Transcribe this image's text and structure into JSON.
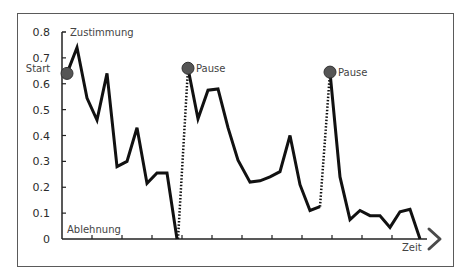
{
  "chart_data": {
    "type": "line",
    "title": "",
    "xlabel": "Zeit",
    "ylabel": "",
    "ylim": [
      0,
      0.8
    ],
    "yticks": [
      "0",
      "0.1",
      "0.2",
      "0.3",
      "0.4",
      "0.5",
      "0.6",
      "0.7",
      "0.8"
    ],
    "ytick_values": [
      0,
      0.1,
      0.2,
      0.3,
      0.4,
      0.5,
      0.6,
      0.7,
      0.8
    ],
    "xlim": [
      0,
      36
    ],
    "xtick_values": [
      3,
      6,
      9,
      12,
      15,
      18,
      21,
      24,
      27,
      30,
      33
    ],
    "grid": false,
    "axis_labels": {
      "top": "Zustimmung",
      "bottom": "Ablehnung",
      "x": "Zeit"
    },
    "series": [
      {
        "name": "Segment 1",
        "style": "solid",
        "x": [
          0.5,
          1.5,
          2.5,
          3.5,
          4.5,
          5.5,
          6.5,
          7.5,
          8.5,
          9.5,
          10.5,
          11.5
        ],
        "values": [
          0.64,
          0.74,
          0.545,
          0.46,
          0.64,
          0.28,
          0.3,
          0.43,
          0.215,
          0.255,
          0.255,
          0
        ]
      },
      {
        "name": "Segment 2",
        "style": "solid",
        "x": [
          12.6,
          13.6,
          14.6,
          15.6,
          16.6,
          17.6,
          18.8,
          19.8,
          20.8,
          21.8,
          22.8,
          23.8,
          24.8,
          25.8
        ],
        "values": [
          0.66,
          0.465,
          0.575,
          0.58,
          0.43,
          0.305,
          0.22,
          0.225,
          0.24,
          0.26,
          0.4,
          0.21,
          0.11,
          0.125
        ]
      },
      {
        "name": "Segment 3",
        "style": "solid",
        "x": [
          26.8,
          27.8,
          28.8,
          29.8,
          30.8,
          31.8,
          32.8,
          33.8,
          34.8,
          35.8
        ],
        "values": [
          0.645,
          0.24,
          0.075,
          0.11,
          0.09,
          0.09,
          0.045,
          0.105,
          0.115,
          0
        ]
      }
    ],
    "connectors": [
      {
        "style": "dotted",
        "from": [
          11.6,
          0
        ],
        "to": [
          12.6,
          0.66
        ]
      },
      {
        "style": "dotted",
        "from": [
          25.8,
          0.125
        ],
        "to": [
          26.8,
          0.645
        ]
      }
    ],
    "markers": [
      {
        "label": "Start",
        "x": 0.5,
        "y": 0.64,
        "label_position": "above-left"
      },
      {
        "label": "Pause",
        "x": 12.6,
        "y": 0.66,
        "label_position": "right"
      },
      {
        "label": "Pause",
        "x": 26.8,
        "y": 0.645,
        "label_position": "right"
      }
    ],
    "colors": {
      "line": "#111111",
      "marker": "#555555",
      "marker_stroke": "#333333",
      "axis": "#222222",
      "arrow": "#4a4a4a"
    }
  }
}
